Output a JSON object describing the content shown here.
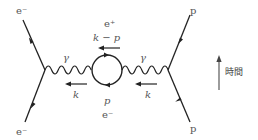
{
  "diagram": {
    "colors": {
      "line": "#222222",
      "text": "#555555",
      "time_arrow": "#666666"
    },
    "labels": {
      "e_minus_top_left": "e⁻",
      "e_minus_bottom_left": "e⁻",
      "p_top_right": "p",
      "p_bottom_right": "p",
      "gamma_left": "γ",
      "gamma_right": "γ",
      "loop_top_particle": "e⁺",
      "loop_top_momentum": "k − p",
      "loop_bottom_momentum": "p",
      "loop_bottom_particle": "e⁻",
      "k_left": "k",
      "k_right": "k",
      "time_label": "時間"
    },
    "icons": {
      "time_arrow": "arrow-up-icon",
      "momentum_arrows": "arrow-left-icon"
    }
  }
}
